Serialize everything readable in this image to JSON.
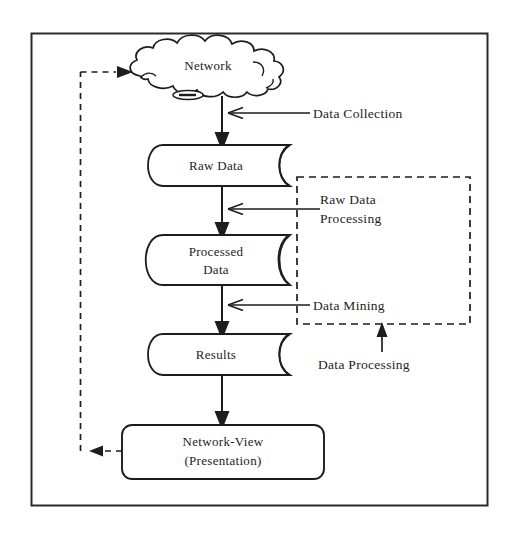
{
  "diagram": {
    "type": "flowchart",
    "orientation": "top-to-bottom",
    "colors": {
      "background": "#ffffff",
      "stroke": "#1d1d1d",
      "text": "#1d1d1d",
      "border": "#2b2b2b"
    },
    "nodes": [
      {
        "id": "network",
        "shape": "cloud",
        "label": "Network",
        "label_lines": [
          "Network"
        ]
      },
      {
        "id": "raw-data",
        "shape": "cylinder",
        "label": "Raw Data",
        "label_lines": [
          "Raw Data"
        ]
      },
      {
        "id": "processed-data",
        "shape": "cylinder",
        "label": "Processed Data",
        "label_lines": [
          "Processed",
          "Data"
        ]
      },
      {
        "id": "results",
        "shape": "cylinder",
        "label": "Results",
        "label_lines": [
          "Results"
        ]
      },
      {
        "id": "network-view",
        "shape": "rounded-rectangle",
        "label": "Network-View (Presentation)",
        "label_lines": [
          "Network-View",
          "(Presentation)"
        ]
      }
    ],
    "annotations": [
      {
        "id": "data-collection",
        "label": "Data Collection",
        "label_lines": [
          "Data Collection"
        ],
        "points_to": "network-to-raw-data-arrow"
      },
      {
        "id": "raw-data-processing",
        "label": "Raw Data Processing",
        "label_lines": [
          "Raw Data",
          "Processing"
        ],
        "points_to": "raw-data-to-processed-data-arrow"
      },
      {
        "id": "data-mining",
        "label": "Data Mining",
        "label_lines": [
          "Data Mining"
        ],
        "points_to": "processed-data-to-results-arrow"
      },
      {
        "id": "data-processing",
        "label": "Data Processing",
        "label_lines": [
          "Data Processing"
        ],
        "points_to": "data-processing-group"
      }
    ],
    "groups": [
      {
        "id": "data-processing-group",
        "style": "dashed-rectangle",
        "contains": [
          "raw-data-processing",
          "data-mining"
        ],
        "label": "Data Processing"
      }
    ],
    "edges": [
      {
        "id": "network-to-raw-data",
        "from": "network",
        "to": "raw-data",
        "style": "solid",
        "arrow": "down"
      },
      {
        "id": "raw-data-to-processed-data",
        "from": "raw-data",
        "to": "processed-data",
        "style": "solid",
        "arrow": "down"
      },
      {
        "id": "processed-data-to-results",
        "from": "processed-data",
        "to": "results",
        "style": "solid",
        "arrow": "down"
      },
      {
        "id": "results-to-network-view",
        "from": "results",
        "to": "network-view",
        "style": "solid",
        "arrow": "down"
      },
      {
        "id": "network-view-feedback-to-network",
        "from": "network-view",
        "to": "network",
        "style": "dashed",
        "arrow": "both"
      }
    ]
  }
}
